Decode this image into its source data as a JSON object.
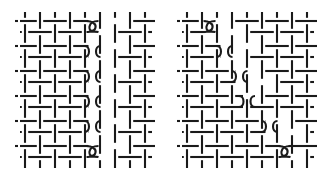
{
  "figure": {
    "width": 328,
    "height": 181,
    "background": "#ffffff",
    "stroke_color": "#1a1a1a",
    "stroke_width": 2.1
  },
  "panels": [
    {
      "id": "left",
      "columns_x": [
        25,
        40,
        55,
        70,
        85,
        100,
        115,
        130,
        145
      ],
      "row_pairs_y": [
        [
          21,
          32
        ],
        [
          46,
          57
        ],
        [
          71,
          82
        ],
        [
          96,
          107
        ],
        [
          121,
          132
        ],
        [
          146,
          157
        ]
      ],
      "x_min": 18,
      "x_max": 152,
      "y_min": 12,
      "y_max": 168,
      "break_columns": [
        {
          "row": 0,
          "x": 92.5,
          "type": "loop"
        },
        {
          "row": 1,
          "x": 92.5,
          "type": "bend"
        },
        {
          "row": 2,
          "x": 92.5,
          "type": "bend"
        },
        {
          "row": 3,
          "x": 92.5,
          "type": "bend"
        },
        {
          "row": 4,
          "x": 92.5,
          "type": "bend"
        },
        {
          "row": 5,
          "x": 92.5,
          "type": "loop"
        }
      ]
    },
    {
      "id": "right",
      "columns_x": [
        187,
        202,
        217,
        232,
        247,
        262,
        277,
        292,
        307
      ],
      "row_pairs_y": [
        [
          21,
          32
        ],
        [
          46,
          57
        ],
        [
          71,
          82
        ],
        [
          96,
          107
        ],
        [
          121,
          132
        ],
        [
          146,
          157
        ]
      ],
      "x_min": 180,
      "x_max": 314,
      "y_min": 12,
      "y_max": 168,
      "break_columns": [
        {
          "row": 0,
          "x": 209.5,
          "type": "loop"
        },
        {
          "row": 1,
          "x": 224.5,
          "type": "bend"
        },
        {
          "row": 2,
          "x": 239.5,
          "type": "bend"
        },
        {
          "row": 3,
          "x": 247,
          "type": "bend-down"
        },
        {
          "row": 4,
          "x": 269.5,
          "type": "bend"
        },
        {
          "row": 5,
          "x": 284.5,
          "type": "loop"
        }
      ]
    }
  ]
}
